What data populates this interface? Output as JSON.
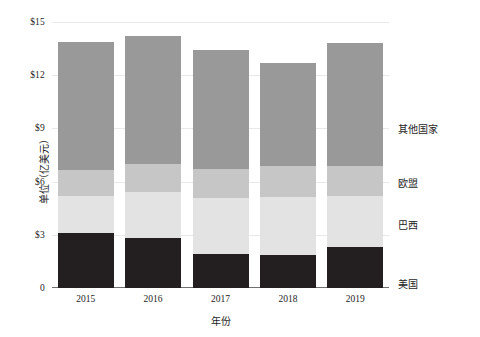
{
  "chart_data": {
    "type": "bar",
    "subtype": "stacked-bar",
    "title": "",
    "xlabel": "年份",
    "ylabel": "单位（亿美元）",
    "categories": [
      "2015",
      "2016",
      "2017",
      "2018",
      "2019"
    ],
    "ylim": [
      0,
      15
    ],
    "yticks": [
      "0",
      "$3",
      "$6",
      "$9",
      "$12",
      "$15"
    ],
    "ytick_values": [
      0,
      3,
      6,
      9,
      12,
      15
    ],
    "grid": true,
    "legend_position": "right",
    "series": [
      {
        "name": "美国",
        "color": "#231f20",
        "values": [
          3.1,
          2.8,
          1.9,
          1.85,
          2.3
        ]
      },
      {
        "name": "巴西",
        "color": "#e3e3e3",
        "values": [
          2.1,
          2.6,
          3.2,
          3.3,
          2.9
        ]
      },
      {
        "name": "欧盟",
        "color": "#c6c6c6",
        "values": [
          1.45,
          1.6,
          1.6,
          1.75,
          1.7
        ]
      },
      {
        "name": "其他国家",
        "color": "#999999",
        "values": [
          7.25,
          7.2,
          6.7,
          5.8,
          6.9
        ]
      }
    ],
    "totals": [
      13.9,
      14.2,
      13.4,
      12.7,
      13.8
    ]
  },
  "legend": {
    "entries": [
      {
        "label": "其他国家",
        "y": 128
      },
      {
        "label": "欧盟",
        "y": 182
      },
      {
        "label": "巴西",
        "y": 224
      },
      {
        "label": "美国",
        "y": 283
      }
    ]
  }
}
